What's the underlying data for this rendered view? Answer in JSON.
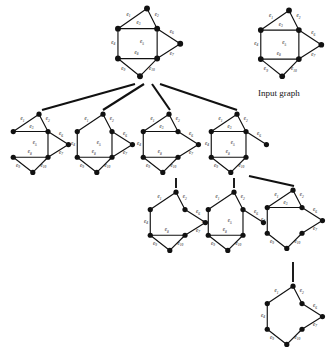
{
  "figure": {
    "type": "diagram",
    "subtype": "graph-enumeration-tree",
    "background_color": "#ffffff",
    "ink_color": "#111111",
    "caption": {
      "text": "Input graph",
      "x": 258,
      "y": 88
    },
    "edge_labels": [
      "e1",
      "e2",
      "e3",
      "e4",
      "e5",
      "e6",
      "e7",
      "e8",
      "e9",
      "e10"
    ],
    "edge_label_display": [
      {
        "id": "e1",
        "base": "e",
        "sub": "1"
      },
      {
        "id": "e2",
        "base": "e",
        "sub": "2"
      },
      {
        "id": "e3",
        "base": "e",
        "sub": "3"
      },
      {
        "id": "e4",
        "base": "e",
        "sub": "4"
      },
      {
        "id": "e5",
        "base": "e",
        "sub": "5"
      },
      {
        "id": "e6",
        "base": "e",
        "sub": "6"
      },
      {
        "id": "e7",
        "base": "e",
        "sub": "7"
      },
      {
        "id": "e8",
        "base": "e",
        "sub": "8"
      },
      {
        "id": "e9",
        "base": "e",
        "sub": "9"
      },
      {
        "id": "e10",
        "base": "e",
        "sub": "10"
      }
    ],
    "base_graph": {
      "vertex_count": 7,
      "edge_count": 10,
      "vertices": [
        {
          "id": "t",
          "x": 0.5,
          "y": 0.035
        },
        {
          "id": "ul",
          "x": 0.085,
          "y": 0.315
        },
        {
          "id": "ur",
          "x": 0.645,
          "y": 0.315
        },
        {
          "id": "r",
          "x": 0.975,
          "y": 0.525
        },
        {
          "id": "ll",
          "x": 0.085,
          "y": 0.73
        },
        {
          "id": "lr",
          "x": 0.645,
          "y": 0.73
        },
        {
          "id": "b",
          "x": 0.4,
          "y": 0.975
        }
      ],
      "edges": [
        {
          "id": "e1",
          "from": "t",
          "to": "ul",
          "label_x": 0.235,
          "label_y": 0.135
        },
        {
          "id": "e2",
          "from": "t",
          "to": "ur",
          "label_x": 0.64,
          "label_y": 0.135
        },
        {
          "id": "e3",
          "from": "ul",
          "to": "ur",
          "label_x": 0.38,
          "label_y": 0.25
        },
        {
          "id": "e4",
          "from": "ul",
          "to": "ll",
          "label_x": 0.018,
          "label_y": 0.53
        },
        {
          "id": "e5",
          "from": "ur",
          "to": "lr",
          "label_x": 0.43,
          "label_y": 0.52
        },
        {
          "id": "e6",
          "from": "ur",
          "to": "r",
          "label_x": 0.855,
          "label_y": 0.375
        },
        {
          "id": "e7",
          "from": "r",
          "to": "lr",
          "label_x": 0.855,
          "label_y": 0.68
        },
        {
          "id": "e8",
          "from": "ll",
          "to": "lr",
          "label_x": 0.35,
          "label_y": 0.665
        },
        {
          "id": "e9",
          "from": "ll",
          "to": "b",
          "label_x": 0.16,
          "label_y": 0.89
        },
        {
          "id": "e10",
          "from": "lr",
          "to": "b",
          "label_x": 0.57,
          "label_y": 0.89
        }
      ]
    },
    "nodes": [
      {
        "id": "root",
        "role": "root",
        "x": 112,
        "y": 6,
        "w": 70,
        "h": 72,
        "removed_edges": [],
        "visible_edges": [
          "e1",
          "e2",
          "e3",
          "e4",
          "e5",
          "e6",
          "e7",
          "e8",
          "e9",
          "e10"
        ],
        "visible_labels": [
          "e1",
          "e2",
          "e3",
          "e4",
          "e5",
          "e6",
          "e7",
          "e8",
          "e9",
          "e10"
        ]
      },
      {
        "id": "input",
        "role": "legend-copy",
        "x": 255,
        "y": 8,
        "w": 68,
        "h": 70,
        "removed_edges": [],
        "visible_edges": [
          "e1",
          "e2",
          "e3",
          "e4",
          "e5",
          "e6",
          "e7",
          "e8",
          "e9",
          "e10"
        ],
        "visible_labels": [
          "e1",
          "e2",
          "e3",
          "e4",
          "e5",
          "e6",
          "e7",
          "e8",
          "e9",
          "e10"
        ]
      },
      {
        "id": "c1",
        "role": "child",
        "x": 8,
        "y": 112,
        "w": 62,
        "h": 62,
        "removed_edges": [
          "e4"
        ],
        "visible_edges": [
          "e1",
          "e2",
          "e3",
          "e5",
          "e6",
          "e7",
          "e8",
          "e9",
          "e10"
        ],
        "visible_labels": [
          "e1",
          "e2",
          "e3",
          "e5",
          "e6",
          "e7",
          "e8",
          "e9",
          "e10"
        ]
      },
      {
        "id": "c2",
        "role": "child",
        "x": 72,
        "y": 112,
        "w": 62,
        "h": 62,
        "removed_edges": [
          "e3"
        ],
        "visible_edges": [
          "e1",
          "e2",
          "e4",
          "e5",
          "e6",
          "e7",
          "e8",
          "e9",
          "e10"
        ],
        "visible_labels": [
          "e1",
          "e2",
          "e4",
          "e5",
          "e6",
          "e7",
          "e8",
          "e9",
          "e10"
        ]
      },
      {
        "id": "c3",
        "role": "child",
        "x": 138,
        "y": 112,
        "w": 62,
        "h": 62,
        "removed_edges": [
          "e5"
        ],
        "visible_edges": [
          "e1",
          "e2",
          "e3",
          "e4",
          "e6",
          "e7",
          "e8",
          "e9",
          "e10"
        ],
        "visible_labels": [
          "e1",
          "e2",
          "e3",
          "e4",
          "e6",
          "e7",
          "e8",
          "e9",
          "e10"
        ]
      },
      {
        "id": "c4",
        "role": "child",
        "x": 206,
        "y": 112,
        "w": 62,
        "h": 62,
        "removed_edges": [
          "e7"
        ],
        "visible_edges": [
          "e1",
          "e2",
          "e3",
          "e4",
          "e5",
          "e6",
          "e8",
          "e9",
          "e10"
        ],
        "visible_labels": [
          "e1",
          "e2",
          "e3",
          "e4",
          "e5",
          "e6",
          "e8",
          "e9",
          "e10"
        ]
      },
      {
        "id": "g1",
        "role": "grandchild",
        "x": 145,
        "y": 190,
        "w": 62,
        "h": 62,
        "removed_edges": [
          "e3",
          "e5"
        ],
        "visible_edges": [
          "e1",
          "e2",
          "e4",
          "e6",
          "e7",
          "e8",
          "e9",
          "e10"
        ],
        "visible_labels": [
          "e1",
          "e2",
          "e4",
          "e6",
          "e7",
          "e8",
          "e9",
          "e10"
        ]
      },
      {
        "id": "g2",
        "role": "grandchild",
        "x": 203,
        "y": 190,
        "w": 62,
        "h": 62,
        "removed_edges": [
          "e3",
          "e7"
        ],
        "visible_edges": [
          "e1",
          "e2",
          "e4",
          "e5",
          "e6",
          "e8",
          "e9",
          "e10"
        ],
        "visible_labels": [
          "e1",
          "e2",
          "e4",
          "e5",
          "e6",
          "e8",
          "e9",
          "e10"
        ]
      },
      {
        "id": "g3",
        "role": "grandchild",
        "x": 262,
        "y": 188,
        "w": 62,
        "h": 62,
        "removed_edges": [
          "e5",
          "e8"
        ],
        "visible_edges": [
          "e1",
          "e2",
          "e3",
          "e4",
          "e6",
          "e7",
          "e9",
          "e10"
        ],
        "visible_labels": [
          "e1",
          "e2",
          "e3",
          "e4",
          "e6",
          "e7",
          "e9",
          "e10"
        ]
      },
      {
        "id": "gg1",
        "role": "great-grandchild",
        "x": 262,
        "y": 284,
        "w": 62,
        "h": 62,
        "removed_edges": [
          "e3",
          "e5",
          "e8"
        ],
        "visible_edges": [
          "e1",
          "e2",
          "e4",
          "e6",
          "e7",
          "e9",
          "e10"
        ],
        "visible_labels": [
          "e1",
          "e2",
          "e4",
          "e6",
          "e7",
          "e9",
          "e10"
        ]
      }
    ],
    "connectors": [
      {
        "id": "k1",
        "from": "root",
        "to": "c1",
        "x1": 135,
        "y1": 84,
        "x2": 42,
        "y2": 110,
        "style": "solid-thick"
      },
      {
        "id": "k2",
        "from": "root",
        "to": "c2",
        "x1": 144,
        "y1": 84,
        "x2": 103,
        "y2": 110,
        "style": "solid-thick"
      },
      {
        "id": "k3",
        "from": "root",
        "to": "c3",
        "x1": 152,
        "y1": 84,
        "x2": 170,
        "y2": 110,
        "style": "solid-thick"
      },
      {
        "id": "k4",
        "from": "root",
        "to": "c4",
        "x1": 160,
        "y1": 84,
        "x2": 237,
        "y2": 110,
        "style": "solid-thick"
      },
      {
        "id": "k5",
        "from": "c3",
        "to": "g1",
        "x1": 176,
        "y1": 178,
        "x2": 176,
        "y2": 188,
        "style": "solid-vertical"
      },
      {
        "id": "k6",
        "from": "c4",
        "to": "g2",
        "x1": 234,
        "y1": 178,
        "x2": 234,
        "y2": 188,
        "style": "solid-vertical"
      },
      {
        "id": "k7",
        "from": "c4",
        "to": "g3",
        "x1": 249,
        "y1": 176,
        "x2": 294,
        "y2": 186,
        "style": "solid-thick"
      },
      {
        "id": "k8",
        "from": "g3",
        "to": "gg1",
        "x1": 293,
        "y1": 262,
        "x2": 293,
        "y2": 282,
        "style": "solid-vertical"
      }
    ]
  }
}
